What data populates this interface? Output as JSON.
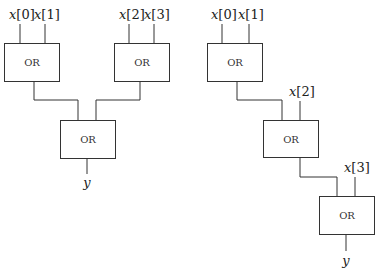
{
  "diagram": {
    "tree_circuit": {
      "inputs": [
        {
          "var": "x",
          "index": "[0]"
        },
        {
          "var": "x",
          "index": "[1]"
        },
        {
          "var": "x",
          "index": "[2]"
        },
        {
          "var": "x",
          "index": "[3]"
        }
      ],
      "gates": [
        {
          "label": "OR"
        },
        {
          "label": "OR"
        },
        {
          "label": "OR"
        }
      ],
      "output": "y"
    },
    "chain_circuit": {
      "inputs": [
        {
          "var": "x",
          "index": "[0]"
        },
        {
          "var": "x",
          "index": "[1]"
        },
        {
          "var": "x",
          "index": "[2]"
        },
        {
          "var": "x",
          "index": "[3]"
        }
      ],
      "gates": [
        {
          "label": "OR"
        },
        {
          "label": "OR"
        },
        {
          "label": "OR"
        }
      ],
      "output": "y"
    }
  }
}
